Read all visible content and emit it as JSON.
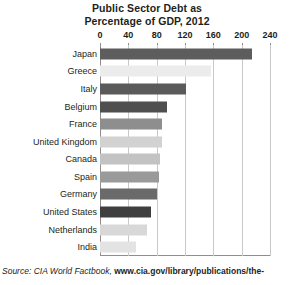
{
  "chart_data": {
    "type": "bar",
    "orientation": "horizontal",
    "title": "Public Sector Debt as Percentage of GDP, 2012",
    "title_lines": [
      "Public Sector Debt as",
      "Percentage of GDP, 2012"
    ],
    "xlabel": "",
    "ylabel": "",
    "xlim": [
      0,
      240
    ],
    "grid": true,
    "legend": "none",
    "xticks": [
      0,
      40,
      80,
      120,
      160,
      200,
      240
    ],
    "xtick_labels": [
      "0",
      "40",
      "80",
      "120",
      "160",
      "200",
      "240"
    ],
    "categories": [
      "Japan",
      "Greece",
      "Italy",
      "Belgium",
      "France",
      "United Kingdom",
      "Canada",
      "Spain",
      "Germany",
      "United States",
      "Netherlands",
      "India"
    ],
    "values": [
      214,
      157,
      121,
      94,
      88,
      87,
      84,
      83,
      80,
      72,
      66,
      51
    ],
    "bar_colors": [
      "#5d5d5d",
      "#ececec",
      "#5a5a5a",
      "#4f4f4f",
      "#8e8e8e",
      "#d2d2d2",
      "#c3c3c3",
      "#9a9a9a",
      "#6a6a6a",
      "#3f3f3f",
      "#d8d8d8",
      "#e3e3e3"
    ]
  },
  "source": {
    "prefix": "Source: CIA World Factbook,",
    "url": "www.cia.gov/library/publications/the-"
  },
  "colors": {
    "text": "#231f20",
    "gridline": "#c9c9c9",
    "axis": "#8e8e8e",
    "background": "#ffffff"
  }
}
